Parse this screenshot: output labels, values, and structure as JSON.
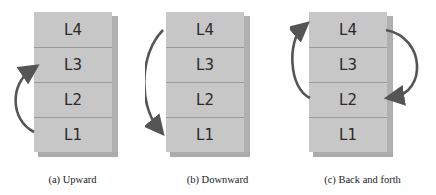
{
  "panels": [
    {
      "id": "a",
      "caption": "(a) Upward",
      "layers": [
        "L4",
        "L3",
        "L2",
        "L1"
      ],
      "arrows": [
        {
          "from": "L1",
          "to": "L3",
          "side": "left"
        }
      ]
    },
    {
      "id": "b",
      "caption": "(b) Downward",
      "layers": [
        "L4",
        "L3",
        "L2",
        "L1"
      ],
      "arrows": [
        {
          "from": "L4",
          "to": "L1",
          "side": "left"
        }
      ]
    },
    {
      "id": "c",
      "caption": "(c) Back and forth",
      "layers": [
        "L4",
        "L3",
        "L2",
        "L1"
      ],
      "arrows": [
        {
          "from": "L2",
          "to": "L4",
          "side": "left"
        },
        {
          "from": "L4",
          "to": "L2",
          "side": "right"
        }
      ]
    }
  ],
  "colors": {
    "block": "#c7c7c7",
    "arrow": "#555555"
  }
}
